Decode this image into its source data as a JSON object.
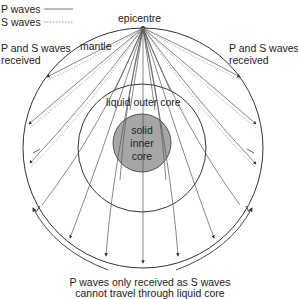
{
  "legend": {
    "p_waves": "P waves",
    "s_waves": "S waves"
  },
  "labels": {
    "epicentre": "epicentre",
    "mantle": "mantle",
    "left_received_1": "P and S waves",
    "left_received_2": "received",
    "right_received_1": "P and S waves",
    "right_received_2": "received",
    "outer_core": "liquid outer core",
    "inner_core_1": "solid",
    "inner_core_2": "inner",
    "inner_core_3": "core",
    "bottom_1": "P waves only received as S waves",
    "bottom_2": "cannot travel through liquid core"
  },
  "colors": {
    "line": "#333333",
    "inner_core_fill": "#a6a6a6",
    "background": "#ffffff"
  }
}
